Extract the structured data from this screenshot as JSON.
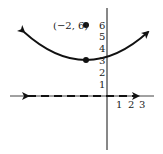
{
  "diagram": {
    "type": "parabola-graph",
    "focus": {
      "x": -2,
      "y": 6,
      "label": "(−2, 6)"
    },
    "vertex": {
      "x": -2,
      "y": 3
    },
    "directrix": {
      "y": 0,
      "style": "dashed",
      "arrows": "both"
    },
    "y_tick_labels": [
      "1",
      "2",
      "3",
      "4",
      "5",
      "6"
    ],
    "x_tick_labels": [
      "1",
      "2",
      "3"
    ],
    "colors": {
      "stroke": "#111111",
      "background": "#ffffff"
    }
  }
}
